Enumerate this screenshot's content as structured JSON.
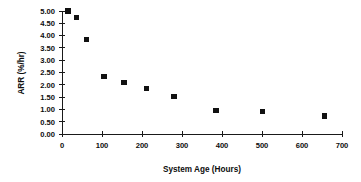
{
  "chart_data": {
    "type": "scatter",
    "title": "",
    "xlabel": "System Age (Hours)",
    "ylabel": "ARR (%/hr)",
    "xlim": [
      0,
      700
    ],
    "ylim": [
      0,
      5.0
    ],
    "grid": false,
    "legend": false,
    "marker": "filled-square",
    "marker_color": "#111111",
    "x_ticks": [
      0,
      100,
      200,
      300,
      400,
      500,
      600,
      700
    ],
    "x_tick_labels": [
      "0",
      "100",
      "200",
      "300",
      "400",
      "500",
      "600",
      "700"
    ],
    "y_ticks": [
      0.0,
      0.5,
      1.0,
      1.5,
      2.0,
      2.5,
      3.0,
      3.5,
      4.0,
      4.5,
      5.0
    ],
    "y_tick_labels": [
      "0.00",
      "0.50",
      "1.00",
      "1.50",
      "2.00",
      "2.50",
      "3.00",
      "3.50",
      "4.00",
      "4.50",
      "5.00"
    ],
    "x": [
      15,
      37,
      62,
      105,
      155,
      212,
      280,
      385,
      502,
      657
    ],
    "values": [
      5.0,
      4.75,
      3.85,
      2.35,
      2.08,
      1.85,
      1.52,
      0.97,
      0.92,
      0.73
    ],
    "points": [
      {
        "x": 15,
        "y": 5.0
      },
      {
        "x": 37,
        "y": 4.75
      },
      {
        "x": 62,
        "y": 3.85
      },
      {
        "x": 105,
        "y": 2.35
      },
      {
        "x": 155,
        "y": 2.08
      },
      {
        "x": 212,
        "y": 1.85
      },
      {
        "x": 280,
        "y": 1.52
      },
      {
        "x": 385,
        "y": 0.97
      },
      {
        "x": 502,
        "y": 0.92
      },
      {
        "x": 657,
        "y": 0.73
      }
    ]
  }
}
